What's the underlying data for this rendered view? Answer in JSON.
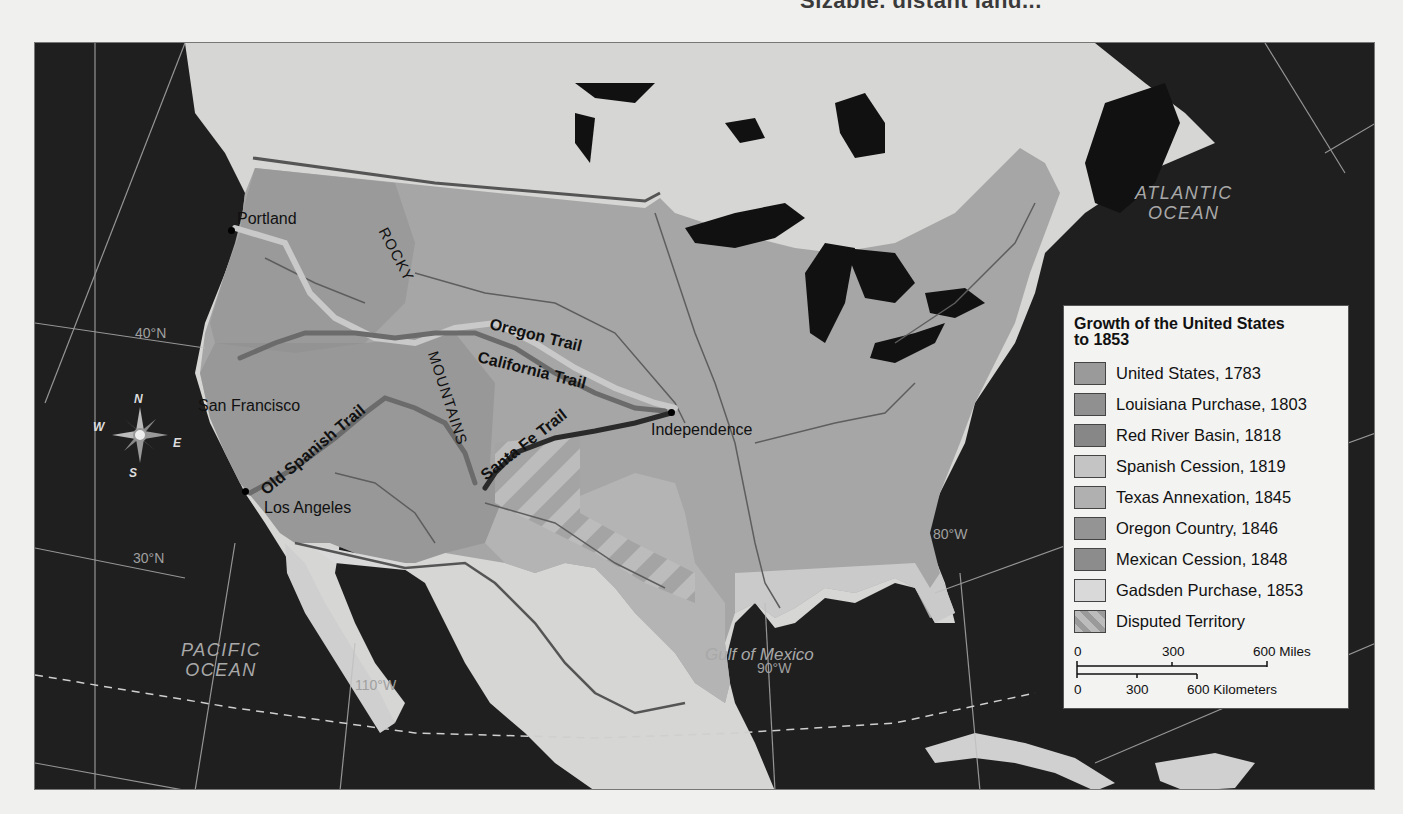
{
  "page": {
    "header_fragment": "Sizable, distant land..."
  },
  "map": {
    "title": "Growth of the United States to 1853",
    "cities": [
      {
        "name": "Portland",
        "x": 230,
        "y": 229
      },
      {
        "name": "San Francisco",
        "x": 196,
        "y": 405
      },
      {
        "name": "Los Angeles",
        "x": 245,
        "y": 490
      },
      {
        "name": "Independence",
        "x": 670,
        "y": 411
      }
    ],
    "trails": [
      {
        "name": "Oregon Trail",
        "color": "#c8c8c8"
      },
      {
        "name": "California Trail",
        "color": "#6e6e6e"
      },
      {
        "name": "Santa Fe Trail",
        "color": "#2e2e2e"
      },
      {
        "name": "Old Spanish Trail",
        "color": "#6e6e6e"
      }
    ],
    "mountains": {
      "rocky": "ROCKY",
      "mountains": "MOUNTAINS"
    },
    "water_bodies": {
      "atlantic": [
        "ATLANTIC",
        "OCEAN"
      ],
      "pacific": [
        "PACIFIC",
        "OCEAN"
      ],
      "gulf": "Gulf of Mexico"
    },
    "coordinates": {
      "lat40": "40°N",
      "lat30": "30°N",
      "lon110": "110°W",
      "lon90": "90°W",
      "lon80": "80°W"
    },
    "compass": {
      "n": "N",
      "s": "S",
      "e": "E",
      "w": "W"
    }
  },
  "legend": {
    "title_line1": "Growth of the United States",
    "title_line2": "to 1853",
    "items": [
      {
        "label": "United States, 1783",
        "color": "#9a9a9a"
      },
      {
        "label": "Louisiana Purchase, 1803",
        "color": "#909090"
      },
      {
        "label": "Red River Basin, 1818",
        "color": "#878787"
      },
      {
        "label": "Spanish Cession, 1819",
        "color": "#c4c4c4"
      },
      {
        "label": "Texas Annexation, 1845",
        "color": "#b0b0b0"
      },
      {
        "label": "Oregon Country, 1846",
        "color": "#949494"
      },
      {
        "label": "Mexican Cession, 1848",
        "color": "#8c8c8c"
      },
      {
        "label": "Gadsden Purchase, 1853",
        "color": "#d9d9d9"
      },
      {
        "label": "Disputed Territory",
        "color": "striped"
      }
    ],
    "scale": {
      "miles": {
        "ticks": [
          "0",
          "300",
          "600 Miles"
        ]
      },
      "km": {
        "ticks": [
          "0",
          "300",
          "600 Kilometers"
        ]
      }
    }
  }
}
